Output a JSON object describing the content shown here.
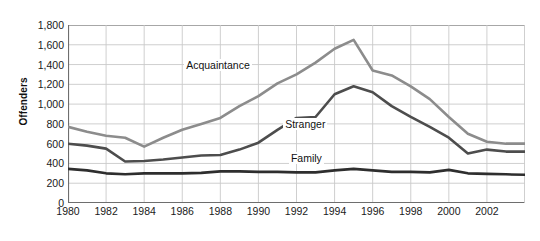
{
  "chart_data": {
    "type": "line",
    "title": "",
    "xlabel": "",
    "ylabel": "Offenders",
    "xlim": [
      1980,
      2004
    ],
    "ylim": [
      0,
      1800
    ],
    "grid": true,
    "legend_position": "inline-annotations",
    "x": [
      1980,
      1981,
      1982,
      1983,
      1984,
      1985,
      1986,
      1987,
      1988,
      1989,
      1990,
      1991,
      1992,
      1993,
      1994,
      1995,
      1996,
      1997,
      1998,
      1999,
      2000,
      2001,
      2002,
      2003,
      2004
    ],
    "xtick_labels": [
      "1980",
      "1982",
      "1984",
      "1986",
      "1988",
      "1990",
      "1992",
      "1994",
      "1996",
      "1998",
      "2000",
      "2002"
    ],
    "xtick_values": [
      1980,
      1982,
      1984,
      1986,
      1988,
      1990,
      1992,
      1994,
      1996,
      1998,
      2000,
      2002
    ],
    "ytick_labels": [
      "1,800",
      "1,600",
      "1,400",
      "1,200",
      "1,000",
      "800",
      "600",
      "400",
      "200",
      "0"
    ],
    "ytick_values": [
      1800,
      1600,
      1400,
      1200,
      1000,
      800,
      600,
      400,
      200,
      0
    ],
    "series": [
      {
        "name": "Acquaintance",
        "color": "#8c8c8c",
        "label_x": 1986.1,
        "label_y": 1390,
        "values": [
          770,
          720,
          680,
          660,
          570,
          660,
          740,
          800,
          860,
          980,
          1080,
          1210,
          1300,
          1420,
          1560,
          1650,
          1340,
          1290,
          1180,
          1050,
          870,
          700,
          620,
          600,
          600
        ]
      },
      {
        "name": "Stranger",
        "color": "#4d4d4d",
        "label_x": 1991.3,
        "label_y": 790,
        "values": [
          600,
          580,
          550,
          420,
          425,
          440,
          460,
          480,
          485,
          540,
          610,
          740,
          860,
          870,
          1100,
          1180,
          1120,
          980,
          870,
          770,
          660,
          500,
          540,
          520,
          520
        ]
      },
      {
        "name": "Family",
        "color": "#2e2e2e",
        "label_x": 1991.6,
        "label_y": 440,
        "values": [
          345,
          330,
          300,
          290,
          300,
          300,
          300,
          305,
          320,
          320,
          315,
          315,
          310,
          310,
          330,
          345,
          330,
          315,
          315,
          310,
          335,
          300,
          295,
          290,
          285
        ]
      }
    ]
  }
}
